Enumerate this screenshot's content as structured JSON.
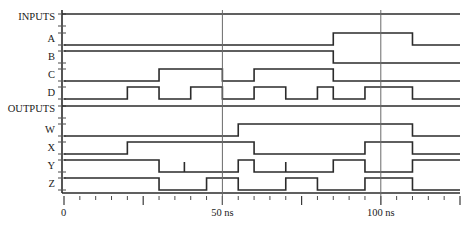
{
  "diagram": {
    "type": "timing-waveform"
  },
  "groups": [
    {
      "id": "inputs",
      "label": "INPUTS"
    },
    {
      "id": "outputs",
      "label": "OUTPUTS"
    }
  ],
  "signals": [
    {
      "id": "A",
      "label": "A"
    },
    {
      "id": "B",
      "label": "B"
    },
    {
      "id": "C",
      "label": "C"
    },
    {
      "id": "D",
      "label": "D"
    },
    {
      "id": "W",
      "label": "W"
    },
    {
      "id": "X",
      "label": "X"
    },
    {
      "id": "Y",
      "label": "Y"
    },
    {
      "id": "Z",
      "label": "Z"
    }
  ],
  "axis": {
    "unit": "ns",
    "min": 0,
    "max": 125,
    "minor_tick_step": 5,
    "major_tick_step": 25,
    "tick_labels": [
      {
        "value": 0,
        "text": "0"
      },
      {
        "value": 50,
        "text": "50 ns"
      },
      {
        "value": 100,
        "text": "100 ns"
      }
    ],
    "cursors": [
      50,
      100
    ]
  },
  "chart_data": {
    "type": "line",
    "xlabel": "ns",
    "ylabel": "",
    "xlim": [
      0,
      125
    ],
    "grid": false,
    "legend": "none",
    "categories": [
      "INPUTS",
      "A",
      "B",
      "C",
      "D",
      "OUTPUTS",
      "W",
      "X",
      "Y",
      "Z"
    ],
    "series": [
      {
        "name": "INPUTS",
        "kind": "group-rail",
        "transitions": [
          [
            0,
            1
          ]
        ]
      },
      {
        "name": "A",
        "kind": "digital",
        "transitions": [
          [
            0,
            0
          ],
          [
            85,
            1
          ],
          [
            110,
            0
          ],
          [
            125,
            0
          ]
        ]
      },
      {
        "name": "B",
        "kind": "digital",
        "transitions": [
          [
            0,
            1
          ],
          [
            85,
            0
          ],
          [
            125,
            0
          ]
        ]
      },
      {
        "name": "C",
        "kind": "digital",
        "transitions": [
          [
            0,
            0
          ],
          [
            30,
            1
          ],
          [
            50,
            0
          ],
          [
            60,
            1
          ],
          [
            85,
            0
          ],
          [
            125,
            0
          ]
        ]
      },
      {
        "name": "D",
        "kind": "digital",
        "transitions": [
          [
            0,
            0
          ],
          [
            20,
            1
          ],
          [
            30,
            0
          ],
          [
            40,
            1
          ],
          [
            50,
            0
          ],
          [
            60,
            1
          ],
          [
            70,
            0
          ],
          [
            80,
            1
          ],
          [
            85,
            0
          ],
          [
            95,
            1
          ],
          [
            110,
            0
          ],
          [
            125,
            0
          ]
        ]
      },
      {
        "name": "OUTPUTS",
        "kind": "group-rail",
        "transitions": [
          [
            0,
            1
          ]
        ]
      },
      {
        "name": "W",
        "kind": "digital",
        "transitions": [
          [
            0,
            0
          ],
          [
            55,
            1
          ],
          [
            110,
            0
          ],
          [
            125,
            0
          ]
        ]
      },
      {
        "name": "X",
        "kind": "digital",
        "transitions": [
          [
            0,
            0
          ],
          [
            20,
            1
          ],
          [
            60,
            0
          ],
          [
            95,
            1
          ],
          [
            110,
            0
          ],
          [
            125,
            0
          ]
        ]
      },
      {
        "name": "Y",
        "kind": "digital",
        "glitches": [
          38,
          70
        ],
        "transitions": [
          [
            0,
            1
          ],
          [
            30,
            0
          ],
          [
            55,
            1
          ],
          [
            60,
            0
          ],
          [
            85,
            1
          ],
          [
            95,
            0
          ],
          [
            110,
            1
          ],
          [
            125,
            1
          ]
        ]
      },
      {
        "name": "Z",
        "kind": "digital",
        "transitions": [
          [
            0,
            1
          ],
          [
            30,
            0
          ],
          [
            45,
            1
          ],
          [
            55,
            0
          ],
          [
            70,
            1
          ],
          [
            80,
            0
          ],
          [
            95,
            1
          ],
          [
            110,
            0
          ],
          [
            125,
            0
          ]
        ]
      }
    ]
  },
  "colors": {
    "waveform": "#2b2b2b",
    "axis": "#2b2b2b",
    "tick": "#4a4a4a",
    "cursor": "#6a6a6a",
    "text": "#1a1a1a",
    "background": "#ffffff"
  }
}
